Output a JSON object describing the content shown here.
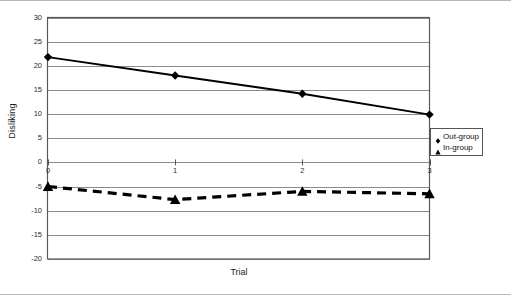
{
  "chart_data": {
    "type": "line",
    "title": "",
    "xlabel": "Trial",
    "ylabel": "Disliking",
    "x": [
      0,
      1,
      2,
      3
    ],
    "xtick_labels": [
      "0",
      "1",
      "2",
      "3"
    ],
    "ytick_labels": [
      "30",
      "25",
      "20",
      "15",
      "10",
      "5",
      "0",
      "-5",
      "-10",
      "-15",
      "-20"
    ],
    "ytick_values": [
      30,
      25,
      20,
      15,
      10,
      5,
      0,
      -5,
      -10,
      -15,
      -20
    ],
    "ylim": [
      -20,
      30
    ],
    "xlim": [
      0,
      3
    ],
    "grid": "horizontal",
    "legend_position": "right",
    "series": [
      {
        "name": "Out-group",
        "marker": "diamond",
        "line_style": "solid",
        "color": "#000000",
        "values": [
          21.8,
          18.0,
          14.2,
          9.9
        ]
      },
      {
        "name": "In-group",
        "marker": "triangle",
        "line_style": "dashed",
        "color": "#000000",
        "values": [
          -5.0,
          -7.7,
          -6.0,
          -6.5
        ]
      }
    ]
  },
  "legend": {
    "items": [
      {
        "label": "Out-group",
        "marker": "diamond-icon"
      },
      {
        "label": "In-group",
        "marker": "triangle-icon"
      }
    ]
  },
  "axes": {
    "x_title": "Trial",
    "y_title": "Disliking"
  }
}
